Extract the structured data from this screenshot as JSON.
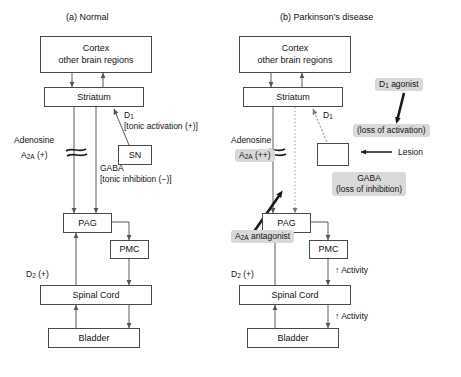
{
  "figure": {
    "panels": [
      {
        "id": "a",
        "title": "(a) Normal",
        "nodes": {
          "cortex": "Cortex\nother brain regions",
          "cortex_line1": "Cortex",
          "cortex_line2": "other brain regions",
          "striatum": "Striatum",
          "sn": "SN",
          "pag": "PAG",
          "pmc": "PMC",
          "spinal_cord": "Spinal Cord",
          "bladder": "Bladder"
        },
        "labels": {
          "d1": "D",
          "d1_sub": "1",
          "d1_note": "[tonic activation (+)]",
          "adenosine": "Adenosine",
          "a2a": "A",
          "a2a_sub": "2A",
          "a2a_sign": "(+)",
          "gaba": "GABA",
          "gaba_note": "[tonic inhibition (−)]",
          "d2": "D",
          "d2_sub": "2",
          "d2_sign": "(+)"
        }
      },
      {
        "id": "b",
        "title": "(b)  Parkinson’s disease",
        "nodes": {
          "cortex_line1": "Cortex",
          "cortex_line2": "other brain regions",
          "striatum": "Striatum",
          "sn_lesioned": "",
          "pag": "PAG",
          "pmc": "PMC",
          "spinal_cord": "Spinal Cord",
          "bladder": "Bladder"
        },
        "labels": {
          "d1": "D",
          "d1_sub": "1",
          "adenosine": "Adenosine",
          "a2a": "A",
          "a2a_sub": "2A",
          "a2a_sign": "(++)",
          "d2": "D",
          "d2_sub": "2",
          "d2_sign": "(+)",
          "activity_pmc": "↑ Activity",
          "activity_bladder": "↑ Activity",
          "lesion": "Lesion"
        },
        "callouts": {
          "d1_agonist_line1": "D",
          "d1_agonist_sub": "1",
          "d1_agonist_line1b": " agonist",
          "loss_of_activation": "(loss of activation)",
          "gaba_line1": "GABA",
          "gaba_line2": "(loss of inhibition)",
          "a2a_antagonist": "A",
          "a2a_antagonist_sub": "2A",
          "a2a_antagonist_rest": " antagonist"
        }
      }
    ],
    "colors": {
      "box_stroke": "#4a4a4a",
      "wire": "#5a5a5a",
      "highlight_bg": "#d9d9d9",
      "bold_arrow": "#1a1a1a",
      "text": "#111111",
      "background": "#ffffff"
    }
  }
}
